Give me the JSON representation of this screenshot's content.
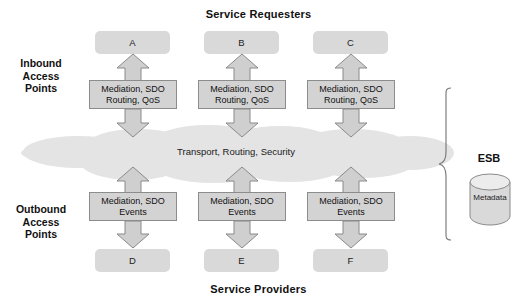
{
  "diagram": {
    "type": "enterprise-service-bus-architecture",
    "titles": {
      "top": "Service Requesters",
      "bottom": "Service Providers"
    },
    "side_labels": {
      "inbound": "Inbound\nAccess\nPoints",
      "outbound": "Outbound\nAccess\nPoints"
    },
    "requesters": [
      {
        "id": "A",
        "label": "A"
      },
      {
        "id": "B",
        "label": "B"
      },
      {
        "id": "C",
        "label": "C"
      }
    ],
    "providers": [
      {
        "id": "D",
        "label": "D"
      },
      {
        "id": "E",
        "label": "E"
      },
      {
        "id": "F",
        "label": "F"
      }
    ],
    "inbound_access_points": [
      {
        "label": "Mediation, SDO\nRouting, QoS"
      },
      {
        "label": "Mediation, SDO\nRouting, QoS"
      },
      {
        "label": "Mediation, SDO\nRouting, QoS"
      }
    ],
    "outbound_access_points": [
      {
        "label": "Mediation, SDO\nEvents"
      },
      {
        "label": "Mediation, SDO\nEvents"
      },
      {
        "label": "Mediation, SDO\nEvents"
      }
    ],
    "bus": {
      "label": "Transport, Routing, Security",
      "shape": "cloud"
    },
    "esb": {
      "title": "ESB",
      "datastore_label": "Metadata",
      "datastore_shape": "cylinder-icon",
      "bracket": "curly-brace-icon"
    },
    "colors": {
      "endpoint_fill": "#d9d9d9",
      "mediation_fill": "#d3d3d3",
      "mediation_stroke": "#8c8c8c",
      "cloud_fill": "#e4e4e4",
      "arrow_fill": "#cfcfcf",
      "arrow_stroke": "#8a8a8a",
      "text": "#1a1a1a"
    }
  }
}
